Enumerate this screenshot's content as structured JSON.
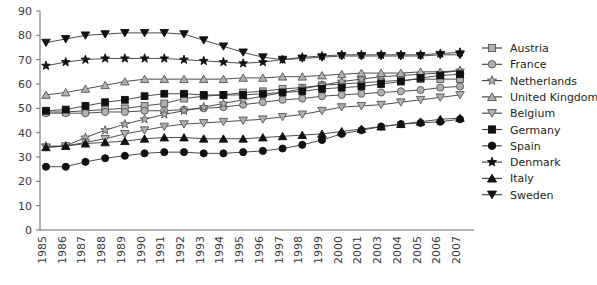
{
  "chart_data": {
    "type": "line",
    "title": "",
    "xlabel": "",
    "ylabel": "",
    "ylim": [
      0,
      90
    ],
    "ytick_step": 10,
    "yticks": [
      0,
      10,
      20,
      30,
      40,
      50,
      60,
      70,
      80,
      90
    ],
    "grid": false,
    "legend_position": "right",
    "categories": [
      "1985",
      "1986",
      "1987",
      "1988",
      "1989",
      "1990",
      "1991",
      "1992",
      "1993",
      "1994",
      "1995",
      "1996",
      "1997",
      "1998",
      "1999",
      "2000",
      "2001",
      "2003",
      "2004",
      "2005",
      "2006",
      "2007"
    ],
    "series": [
      {
        "name": "Austria",
        "marker": "square-open",
        "color": "#8c8c8c",
        "fill": "#b3b3b3",
        "values": [
          48.5,
          48.5,
          49.0,
          49.5,
          50.0,
          51.0,
          52.0,
          54.0,
          55.0,
          55.5,
          56.5,
          57.0,
          58.0,
          58.5,
          59.5,
          60.0,
          60.5,
          61.0,
          61.5,
          62.0,
          62.0,
          62.0
        ]
      },
      {
        "name": "France",
        "marker": "circle-open",
        "color": "#8c8c8c",
        "fill": "#b3b3b3",
        "values": [
          48.0,
          48.0,
          48.0,
          48.5,
          48.5,
          49.0,
          49.0,
          49.5,
          50.0,
          50.5,
          51.5,
          52.5,
          53.5,
          54.0,
          55.0,
          55.5,
          56.0,
          56.5,
          57.0,
          57.5,
          58.5,
          59.0
        ]
      },
      {
        "name": "Netherlands",
        "marker": "star-open",
        "color": "#8c8c8c",
        "fill": "#b3b3b3",
        "values": [
          34.5,
          34.5,
          38.0,
          41.0,
          43.5,
          45.5,
          47.5,
          49.0,
          50.5,
          52.0,
          53.5,
          55.0,
          56.5,
          58.0,
          59.5,
          61.0,
          62.0,
          63.0,
          63.5,
          64.0,
          64.5,
          65.5
        ]
      },
      {
        "name": "United Kingdom",
        "marker": "triangle-open",
        "color": "#8c8c8c",
        "fill": "#b3b3b3",
        "values": [
          55.5,
          56.5,
          58.0,
          59.5,
          61.0,
          62.0,
          62.0,
          62.0,
          62.0,
          62.0,
          62.5,
          62.5,
          63.0,
          63.0,
          63.5,
          64.0,
          64.5,
          64.5,
          64.5,
          65.0,
          65.0,
          65.5
        ]
      },
      {
        "name": "Belgium",
        "marker": "triangle-down-open",
        "color": "#8c8c8c",
        "fill": "#b3b3b3",
        "values": [
          34.0,
          34.5,
          36.0,
          37.5,
          39.5,
          41.0,
          42.5,
          43.5,
          44.0,
          44.5,
          45.0,
          45.5,
          46.5,
          47.5,
          49.0,
          50.5,
          51.0,
          51.5,
          52.5,
          53.5,
          54.5,
          55.5
        ]
      },
      {
        "name": "Germany",
        "marker": "square-filled",
        "color": "#111111",
        "fill": "#111111",
        "values": [
          49.0,
          49.5,
          51.0,
          52.5,
          53.5,
          55.0,
          56.0,
          56.0,
          55.5,
          55.5,
          55.5,
          56.0,
          56.5,
          57.0,
          58.0,
          58.5,
          59.0,
          60.0,
          61.0,
          62.5,
          63.5,
          64.0
        ]
      },
      {
        "name": "Spain",
        "marker": "circle-filled",
        "color": "#111111",
        "fill": "#111111",
        "values": [
          26.0,
          26.0,
          28.0,
          29.5,
          30.5,
          31.5,
          32.0,
          32.0,
          31.5,
          31.5,
          32.0,
          32.5,
          33.5,
          35.0,
          37.0,
          39.5,
          41.0,
          42.5,
          43.5,
          44.0,
          44.5,
          45.5
        ]
      },
      {
        "name": "Denmark",
        "marker": "star-filled",
        "color": "#111111",
        "fill": "#111111",
        "values": [
          67.5,
          69.0,
          70.0,
          70.5,
          70.5,
          70.5,
          70.5,
          70.0,
          69.5,
          69.0,
          68.5,
          69.0,
          70.0,
          71.0,
          71.5,
          72.0,
          72.0,
          72.0,
          72.0,
          72.0,
          72.5,
          73.0
        ]
      },
      {
        "name": "Italy",
        "marker": "triangle-filled",
        "color": "#111111",
        "fill": "#111111",
        "values": [
          34.0,
          34.5,
          35.5,
          36.0,
          36.5,
          37.5,
          38.0,
          38.0,
          37.5,
          37.5,
          37.5,
          38.0,
          38.5,
          39.0,
          39.5,
          40.5,
          41.5,
          42.5,
          43.5,
          44.5,
          45.5,
          46.0
        ]
      },
      {
        "name": "Sweden",
        "marker": "triangle-down-filled",
        "color": "#111111",
        "fill": "#111111",
        "values": [
          77.0,
          78.5,
          80.0,
          80.5,
          81.0,
          81.0,
          81.0,
          80.5,
          78.0,
          75.5,
          73.0,
          71.0,
          70.0,
          70.5,
          71.0,
          71.5,
          71.5,
          71.5,
          71.5,
          71.5,
          72.0,
          72.0
        ]
      }
    ]
  }
}
